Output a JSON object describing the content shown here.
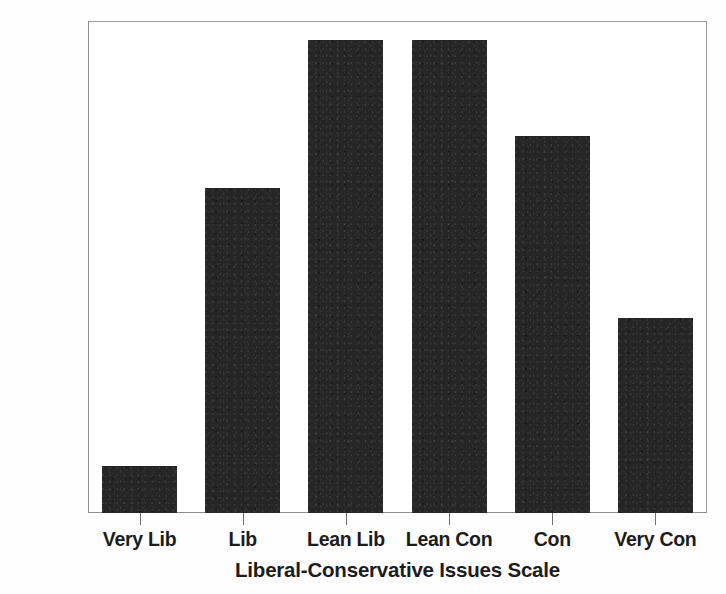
{
  "chart_data": {
    "type": "bar",
    "title": "",
    "subtitle": "",
    "xlabel": "Liberal-Conservative Issues Scale",
    "ylabel": "",
    "categories": [
      "Very Lib",
      "Lib",
      "Lean Lib",
      "Lean Con",
      "Con",
      "Very Con"
    ],
    "values": [
      2.5,
      17.2,
      25.0,
      25.0,
      19.9,
      10.3
    ],
    "value_unit": "%",
    "ylim": [
      0.0,
      26.0
    ],
    "ytick_values": [
      0.0,
      5.0,
      10.0,
      15.0,
      20.0,
      25.0
    ],
    "ytick_labels": [
      "0.0%",
      "5.0%",
      "10.0%",
      "15.0%",
      "20.0%",
      "25.0%"
    ],
    "grid": false,
    "legend": "none",
    "bar_color": "#262626",
    "frame_color": "#8d8d8d",
    "background_color": "#ffffff",
    "text_color": "#1c1c1c",
    "orientation": "vertical",
    "series": [
      {
        "name": "Percent of respondents",
        "values": [
          2.5,
          17.2,
          25.0,
          25.0,
          19.9,
          10.3
        ]
      }
    ]
  },
  "axes": {
    "y": {
      "ticks": [
        {
          "label": "25.0%",
          "value": 25.0
        },
        {
          "label": "20.0%",
          "value": 20.0
        },
        {
          "label": "15.0%",
          "value": 15.0
        },
        {
          "label": "10.0%",
          "value": 10.0
        },
        {
          "label": "5.0%",
          "value": 5.0
        },
        {
          "label": "0.0%",
          "value": 0.0
        }
      ]
    },
    "x": {
      "title": "Liberal-Conservative Issues Scale",
      "ticks": [
        {
          "label": "Very Lib"
        },
        {
          "label": "Lib"
        },
        {
          "label": "Lean Lib"
        },
        {
          "label": "Lean Con"
        },
        {
          "label": "Con"
        },
        {
          "label": "Very Con"
        }
      ]
    }
  }
}
